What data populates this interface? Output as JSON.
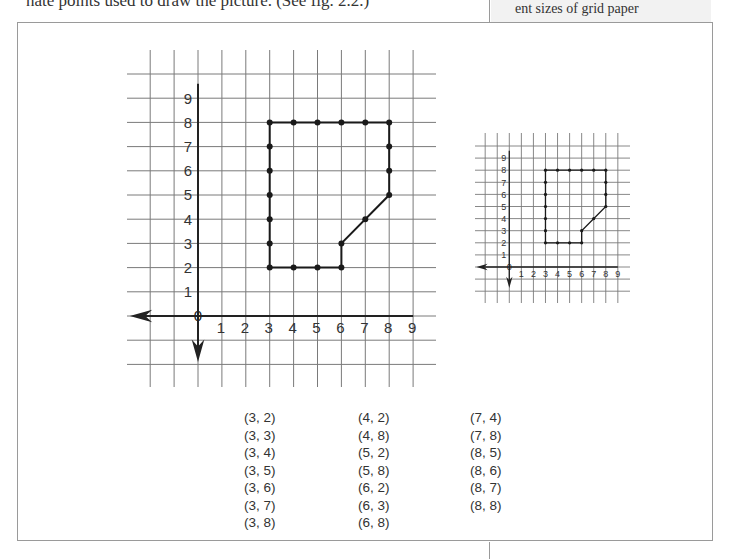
{
  "page": {
    "top_text": "nate points used to draw the picture. (See fig. 2.2.)",
    "sidebar_text": "ent sizes of grid paper"
  },
  "figure": {
    "large_grid": {
      "x_labels": [
        "1",
        "2",
        "3",
        "4",
        "5",
        "6",
        "7",
        "8",
        "9"
      ],
      "y_labels": [
        "1",
        "2",
        "3",
        "4",
        "5",
        "6",
        "7",
        "8",
        "9"
      ],
      "origin_label": "0"
    },
    "small_grid": {
      "x_labels": [
        "1",
        "2",
        "3",
        "4",
        "5",
        "6",
        "7",
        "8",
        "9"
      ],
      "y_labels": [
        "1",
        "2",
        "3",
        "4",
        "5",
        "6",
        "7",
        "8",
        "9"
      ],
      "origin_label": "0"
    },
    "shape_outline": [
      [
        3,
        2
      ],
      [
        3,
        8
      ],
      [
        8,
        8
      ],
      [
        8,
        5
      ],
      [
        6,
        3
      ],
      [
        6,
        2
      ],
      [
        3,
        2
      ]
    ],
    "points": [
      [
        3,
        2
      ],
      [
        3,
        3
      ],
      [
        3,
        4
      ],
      [
        3,
        5
      ],
      [
        3,
        6
      ],
      [
        3,
        7
      ],
      [
        3,
        8
      ],
      [
        4,
        2
      ],
      [
        4,
        8
      ],
      [
        5,
        2
      ],
      [
        5,
        8
      ],
      [
        6,
        2
      ],
      [
        6,
        3
      ],
      [
        6,
        8
      ],
      [
        7,
        4
      ],
      [
        7,
        8
      ],
      [
        8,
        5
      ],
      [
        8,
        6
      ],
      [
        8,
        7
      ],
      [
        8,
        8
      ]
    ],
    "coordinate_columns": [
      [
        "(3, 2)",
        "(3, 3)",
        "(3, 4)",
        "(3, 5)",
        "(3, 6)",
        "(3, 7)",
        "(3, 8)"
      ],
      [
        "(4, 2)",
        "(4, 8)",
        "(5, 2)",
        "(5, 8)",
        "(6, 2)",
        "(6, 3)",
        "(6, 8)"
      ],
      [
        "(7, 4)",
        "(7, 8)",
        "(8, 5)",
        "(8, 6)",
        "(8, 7)",
        "(8, 8)"
      ]
    ]
  },
  "colors": {
    "grid": "#7a7a7a",
    "axis": "#222222",
    "shape": "#1a1a1a",
    "text": "#333333",
    "frame": "#9a9a9a",
    "sidebar_bg": "#f2f2f2"
  }
}
